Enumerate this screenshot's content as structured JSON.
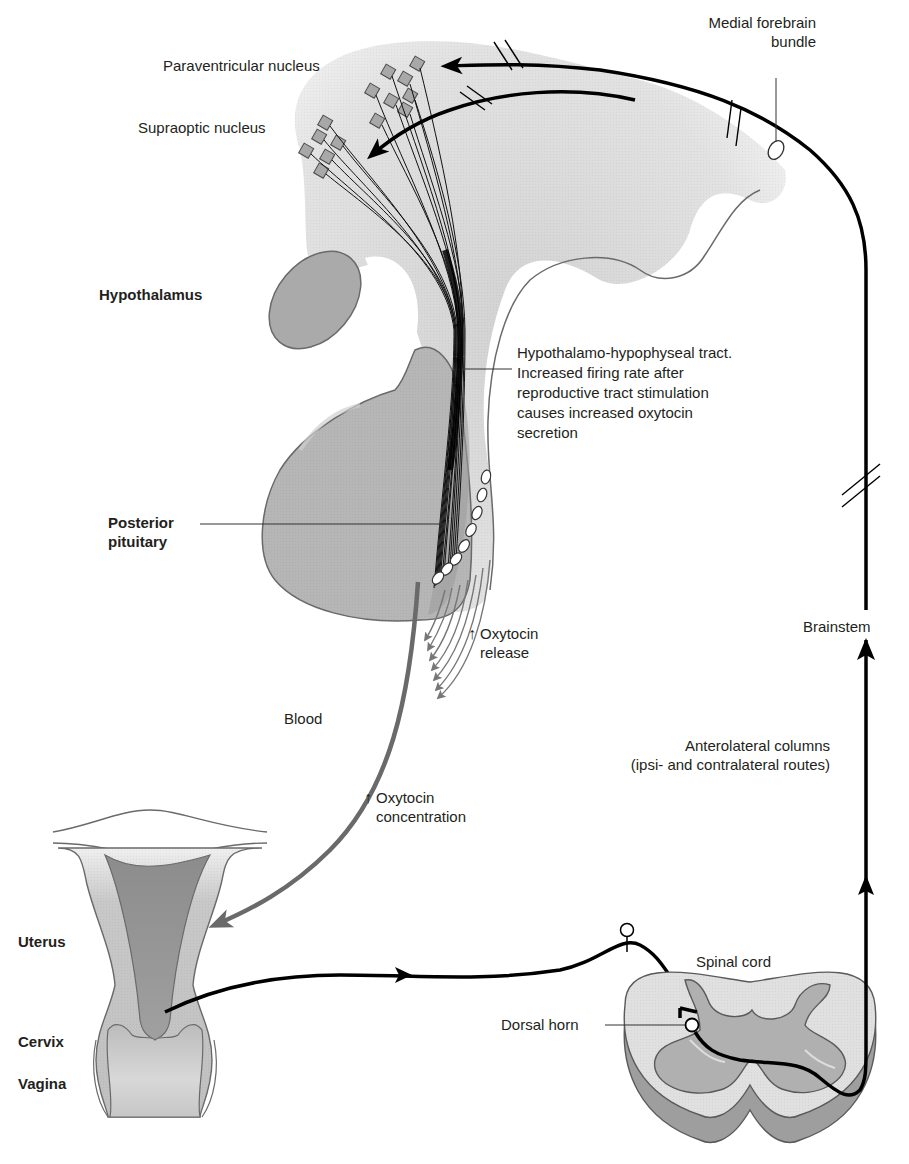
{
  "colors": {
    "background": "#ffffff",
    "tissue_light": "#dcdcdc",
    "tissue_mid": "#b4b4b4",
    "tissue_dark": "#8e8e8e",
    "outline": "#5a5a5a",
    "nerve_path": "#000000",
    "blood_path": "#666666",
    "text": "#231f20"
  },
  "labels": {
    "paraventricular_nucleus": "Paraventricular nucleus",
    "supraoptic_nucleus": "Supraoptic nucleus",
    "medial_forebrain_bundle_line1": "Medial forebrain",
    "medial_forebrain_bundle_line2": "bundle",
    "hypothalamus": "Hypothalamus",
    "tract_line1": "Hypothalamo-hypophyseal tract.",
    "tract_line2": "Increased firing rate after",
    "tract_line3": "reproductive tract stimulation",
    "tract_line4": "causes increased oxytocin",
    "tract_line5": "secretion",
    "posterior_pituitary_line1": "Posterior",
    "posterior_pituitary_line2": "pituitary",
    "oxytocin_release_line1": "Oxytocin",
    "oxytocin_release_line2": "release",
    "brainstem": "Brainstem",
    "blood": "Blood",
    "anterolateral_line1": "Anterolateral columns",
    "anterolateral_line2": "(ipsi- and contralateral routes)",
    "oxytocin_conc_line1": "Oxytocin",
    "oxytocin_conc_line2": "concentration",
    "uterus": "Uterus",
    "cervix": "Cervix",
    "vagina": "Vagina",
    "spinal_cord": "Spinal cord",
    "dorsal_horn": "Dorsal horn",
    "up_arrow": "↑"
  }
}
